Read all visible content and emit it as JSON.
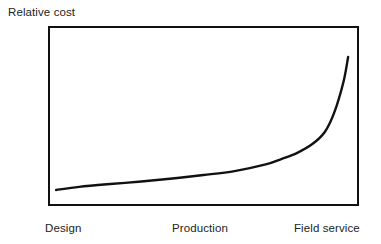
{
  "chart_data": {
    "type": "line",
    "title": "",
    "subtitle": "",
    "ylabel": "Relative cost",
    "xlabel": "",
    "grid": false,
    "legend": null,
    "axis_ticks_numeric": false,
    "xlim": [
      0,
      100
    ],
    "ylim": [
      0,
      100
    ],
    "annotations": [],
    "categories": [
      "Design",
      "Production",
      "Field service"
    ],
    "category_positions": [
      0,
      50,
      100
    ],
    "series": [
      {
        "name": "Relative cost",
        "color": "#111111",
        "x": [
          2.6,
          10,
          20,
          30,
          40,
          50,
          60,
          70,
          75,
          80,
          85,
          89,
          92,
          95,
          96.5
        ],
        "values": [
          8.9,
          10.6,
          12.2,
          13.6,
          15.3,
          17.2,
          19.4,
          23.1,
          26.1,
          29.4,
          34.4,
          41.1,
          51.7,
          68.9,
          82.8
        ]
      }
    ]
  },
  "figure": {
    "ylabel": "Relative cost",
    "xticks": [
      {
        "label": "Design"
      },
      {
        "label": "Production"
      },
      {
        "label": "Field service"
      }
    ],
    "frame": {
      "border_color": "#111111",
      "background": "#ffffff"
    },
    "curve": {
      "stroke": "#111111",
      "stroke_width": "2.4"
    }
  }
}
